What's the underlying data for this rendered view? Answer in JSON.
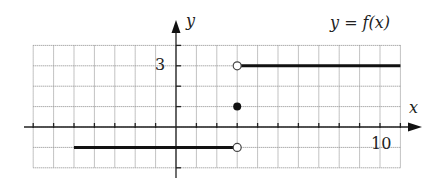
{
  "chart_data": {
    "type": "line",
    "title": "y = f(x)",
    "xlabel": "x",
    "ylabel": "y",
    "xlim": [
      -7,
      11
    ],
    "ylim": [
      -2,
      4
    ],
    "grid": true,
    "tick_labels": {
      "x": [
        "10"
      ],
      "y": [
        "3"
      ]
    },
    "segments": [
      {
        "x": [
          -5,
          3
        ],
        "y": [
          -1,
          -1
        ],
        "left_endpoint": "none",
        "right_endpoint": "open"
      },
      {
        "x": [
          3,
          11
        ],
        "y": [
          3,
          3
        ],
        "left_endpoint": "open",
        "right_endpoint": "none"
      }
    ],
    "points": [
      {
        "x": 3,
        "y": 1,
        "style": "filled"
      }
    ],
    "annotations": [
      "y = f(x)"
    ]
  },
  "labels": {
    "function": "y = f(x)",
    "x_axis": "x",
    "y_axis": "y",
    "tick_y3": "3",
    "tick_x10": "10"
  }
}
